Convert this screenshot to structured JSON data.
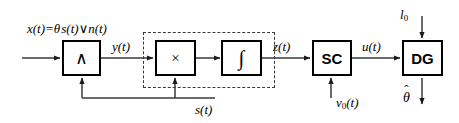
{
  "diagram": {
    "background_color": "#ffffff",
    "line_color": "#3a3a3a",
    "block_border_color": "#000000",
    "dashed_border_color": "#3a3a3a",
    "blocks": [
      {
        "id": "and",
        "glyph": "∧",
        "name": "and-gate-block"
      },
      {
        "id": "multiplier",
        "glyph": "×",
        "name": "multiplier-block"
      },
      {
        "id": "integrator",
        "glyph": "∫",
        "name": "integrator-block"
      },
      {
        "id": "sc",
        "glyph": "SC",
        "name": "sc-block"
      },
      {
        "id": "dg",
        "glyph": "DG",
        "name": "dg-block"
      }
    ],
    "labels": {
      "input_equation_x": "x(t)=",
      "input_equation_theta": "θ",
      "input_equation_s": "s(t)",
      "input_equation_or": "∨",
      "input_equation_n": "n(t)",
      "y_signal": "y(t)",
      "z_signal": "z(t)",
      "u_signal": "u(t)",
      "s_feedback": "s(t)",
      "v0_input": "v",
      "v0_subscript": "0",
      "v0_suffix": "(t)",
      "l0_input": "l",
      "l0_subscript": "0",
      "theta_output": "θ",
      "theta_hat_mark": "ˆ"
    }
  }
}
